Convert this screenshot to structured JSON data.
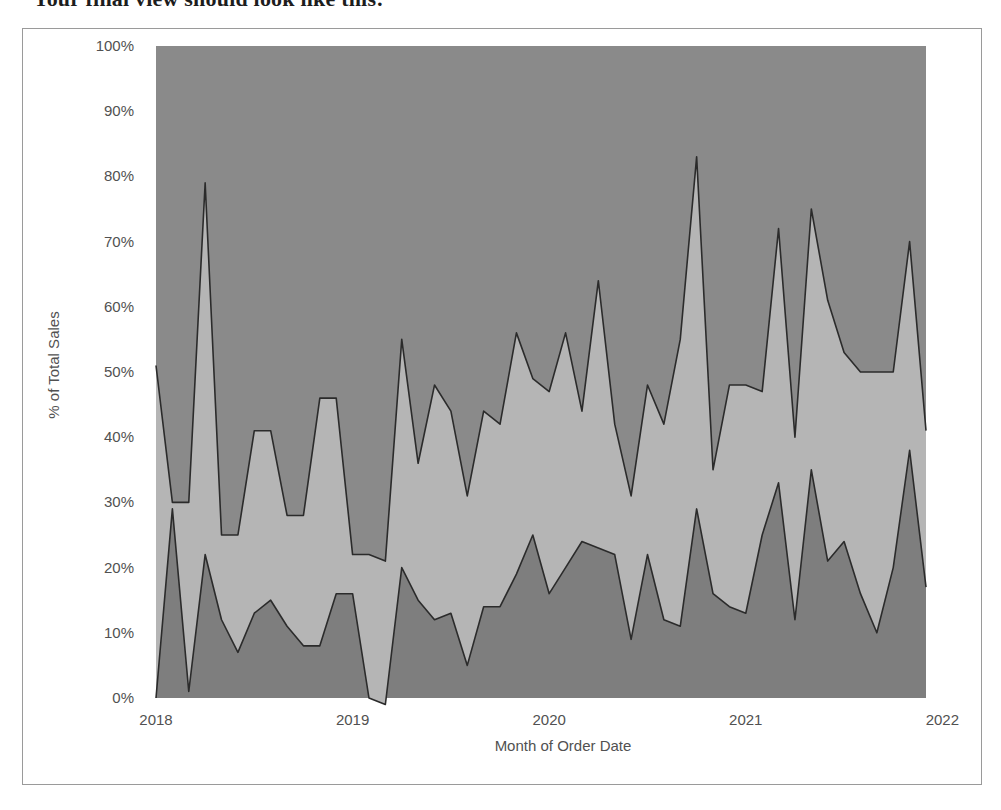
{
  "caption": {
    "text": "Your final view should look like this:"
  },
  "chart_data": {
    "type": "area",
    "stacked": true,
    "normalized": true,
    "title": "",
    "xlabel": "Month of Order Date",
    "ylabel": "% of Total Sales",
    "grid": false,
    "legend": "none",
    "ylim": [
      0,
      100
    ],
    "ytick_labels": [
      "0%",
      "10%",
      "20%",
      "30%",
      "40%",
      "50%",
      "60%",
      "70%",
      "80%",
      "90%",
      "100%"
    ],
    "ytick_values": [
      0,
      10,
      20,
      30,
      40,
      50,
      60,
      70,
      80,
      90,
      100
    ],
    "xtick_labels": [
      "2018",
      "2019",
      "2020",
      "2021",
      "2022"
    ],
    "xtick_values": [
      0,
      12,
      24,
      36,
      48
    ],
    "x_domain": [
      0,
      47
    ],
    "x": [
      "2018-01",
      "2018-02",
      "2018-03",
      "2018-04",
      "2018-05",
      "2018-06",
      "2018-07",
      "2018-08",
      "2018-09",
      "2018-10",
      "2018-11",
      "2018-12",
      "2019-01",
      "2019-02",
      "2019-03",
      "2019-04",
      "2019-05",
      "2019-06",
      "2019-07",
      "2019-08",
      "2019-09",
      "2019-10",
      "2019-11",
      "2019-12",
      "2020-01",
      "2020-02",
      "2020-03",
      "2020-04",
      "2020-05",
      "2020-06",
      "2020-07",
      "2020-08",
      "2020-09",
      "2020-10",
      "2020-11",
      "2020-12",
      "2021-01",
      "2021-02",
      "2021-03",
      "2021-04",
      "2021-05",
      "2021-06",
      "2021-07",
      "2021-08",
      "2021-09",
      "2021-10",
      "2021-11",
      "2021-12"
    ],
    "series": [
      {
        "name": "bottom-band",
        "color": "#7e7e7e",
        "values": [
          0,
          29,
          1,
          22,
          12,
          7,
          13,
          15,
          11,
          8,
          8,
          16,
          16,
          0,
          -1,
          20,
          15,
          12,
          13,
          5,
          14,
          14,
          19,
          25,
          16,
          20,
          24,
          23,
          22,
          9,
          22,
          12,
          11,
          29,
          16,
          14,
          13,
          25,
          33,
          12,
          35,
          21,
          24,
          16,
          10,
          20,
          38,
          17
        ]
      },
      {
        "name": "middle-band",
        "color": "#b5b5b5",
        "values": [
          51,
          1,
          29,
          57,
          13,
          18,
          28,
          26,
          17,
          20,
          38,
          30,
          6,
          22,
          22,
          35,
          21,
          36,
          31,
          26,
          30,
          28,
          37,
          24,
          31,
          36,
          20,
          41,
          20,
          22,
          26,
          30,
          44,
          54,
          19,
          34,
          35,
          22,
          39,
          28,
          40,
          40,
          29,
          34,
          40,
          30,
          32,
          24
        ]
      },
      {
        "name": "top-band",
        "color": "#8a8a8a",
        "values": [
          49,
          70,
          70,
          21,
          75,
          75,
          59,
          59,
          72,
          72,
          54,
          54,
          78,
          78,
          79,
          45,
          64,
          52,
          56,
          69,
          56,
          58,
          44,
          51,
          53,
          44,
          56,
          36,
          58,
          69,
          52,
          58,
          45,
          17,
          65,
          52,
          52,
          53,
          28,
          60,
          25,
          39,
          47,
          50,
          50,
          50,
          30,
          59
        ]
      }
    ],
    "cumulative_lower_boundary": [
      0,
      29,
      1,
      22,
      12,
      7,
      13,
      15,
      11,
      8,
      8,
      16,
      16,
      0,
      -1,
      20,
      15,
      12,
      13,
      5,
      14,
      14,
      19,
      25,
      16,
      20,
      24,
      23,
      22,
      9,
      22,
      12,
      11,
      29,
      16,
      14,
      13,
      25,
      33,
      12,
      35,
      21,
      24,
      16,
      10,
      20,
      38,
      17
    ],
    "cumulative_upper_boundary": [
      51,
      30,
      30,
      79,
      25,
      25,
      41,
      41,
      28,
      28,
      46,
      46,
      22,
      22,
      21,
      55,
      36,
      48,
      44,
      31,
      44,
      42,
      56,
      49,
      47,
      56,
      44,
      64,
      42,
      31,
      48,
      42,
      55,
      83,
      35,
      48,
      48,
      47,
      72,
      40,
      75,
      61,
      53,
      50,
      50,
      50,
      70,
      41
    ]
  }
}
